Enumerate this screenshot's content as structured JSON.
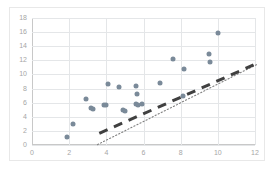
{
  "chart_data": {
    "type": "scatter",
    "title": "",
    "subtitle": "",
    "xlabel": "",
    "ylabel": "",
    "xlim": [
      0,
      12
    ],
    "ylim": [
      0,
      18
    ],
    "xticks": [
      0,
      2,
      4,
      6,
      8,
      10,
      12
    ],
    "yticks": [
      0,
      2,
      4,
      6,
      8,
      10,
      12,
      14,
      16,
      18
    ],
    "grid": true,
    "legend": "none",
    "series": [
      {
        "name": "data",
        "marker": "circle",
        "color": "#7a8a99",
        "points": [
          [
            1.9,
            1.2
          ],
          [
            2.2,
            3.0
          ],
          [
            2.9,
            6.5
          ],
          [
            3.2,
            5.3
          ],
          [
            3.3,
            5.1
          ],
          [
            3.9,
            5.6
          ],
          [
            4.0,
            5.6
          ],
          [
            4.1,
            8.7
          ],
          [
            4.7,
            8.2
          ],
          [
            4.9,
            4.9
          ],
          [
            5.0,
            4.8
          ],
          [
            5.6,
            8.3
          ],
          [
            5.65,
            7.2
          ],
          [
            5.6,
            5.8
          ],
          [
            5.7,
            5.7
          ],
          [
            5.9,
            5.8
          ],
          [
            6.9,
            8.8
          ],
          [
            7.6,
            12.2
          ],
          [
            8.1,
            6.9
          ],
          [
            8.2,
            10.8
          ],
          [
            9.5,
            12.9
          ],
          [
            9.6,
            11.8
          ],
          [
            10.0,
            15.9
          ]
        ]
      }
    ],
    "trendline": {
      "type": "linear",
      "style": "dotted",
      "color": "#808080",
      "x_start": 1.8,
      "y_start": 2.6,
      "x_end": 10.4,
      "y_end": 14.0
    },
    "overlay_dashes": {
      "style": "thick-dashed",
      "color": "#404040",
      "x_start": 1.9,
      "y_start": 4.2,
      "x_end": 10.2,
      "y_end": 13.9
    }
  },
  "axes": {
    "y_labels": [
      "18",
      "16",
      "14",
      "12",
      "10",
      "8",
      "6",
      "4",
      "2",
      "0"
    ],
    "x_labels": [
      "0",
      "2",
      "4",
      "6",
      "8",
      "10",
      "12"
    ]
  }
}
